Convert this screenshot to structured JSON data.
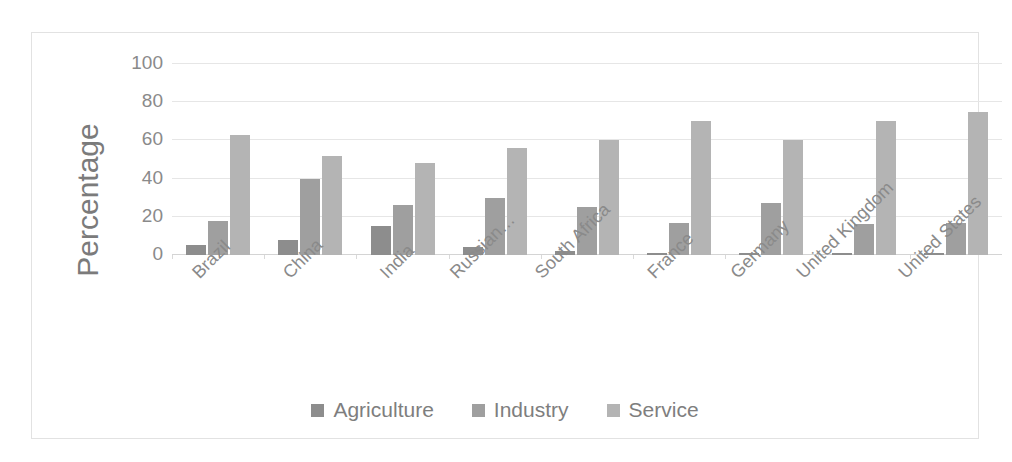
{
  "chart_data": {
    "type": "bar",
    "title": "",
    "xlabel": "",
    "ylabel": "Percentage",
    "ylim": [
      0,
      100
    ],
    "yticks": [
      100,
      80,
      60,
      40,
      20,
      0
    ],
    "grid": true,
    "legend_position": "bottom",
    "categories": [
      "Brazil",
      "China",
      "India",
      "Russian…",
      "South Africa",
      "France",
      "Germany",
      "United Kingdom",
      "United States"
    ],
    "series": [
      {
        "name": "Agriculture",
        "color": "#8d8d8d",
        "values": [
          5,
          8,
          15,
          4,
          2,
          1,
          1,
          1,
          1
        ]
      },
      {
        "name": "Industry",
        "color": "#9f9f9f",
        "values": [
          18,
          40,
          26,
          30,
          25,
          17,
          27,
          16,
          17
        ]
      },
      {
        "name": "Service",
        "color": "#b4b4b4",
        "values": [
          63,
          52,
          48,
          56,
          60,
          70,
          60,
          70,
          75
        ]
      }
    ]
  },
  "legend": {
    "items": [
      {
        "label": "Agriculture",
        "color": "#8d8d8d"
      },
      {
        "label": "Industry",
        "color": "#9f9f9f"
      },
      {
        "label": "Service",
        "color": "#b4b4b4"
      }
    ]
  }
}
